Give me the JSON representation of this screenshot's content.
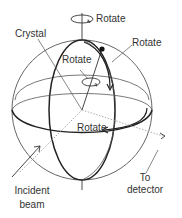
{
  "diagram": {
    "title": "",
    "labels": {
      "rotate_top": "Rotate",
      "crystal": "Crystal",
      "rotate_right": "Rotate",
      "rotate_inner": "Rotate",
      "rotate_equator": "Rotate",
      "incident_line1": "Incident",
      "incident_line2": "beam",
      "detector_line1": "To",
      "detector_line2": "detector"
    },
    "colors": {
      "line": "#444444",
      "thick_line": "#222222",
      "dotted": "#999999",
      "text": "#333333",
      "background": "#ffffff"
    }
  }
}
